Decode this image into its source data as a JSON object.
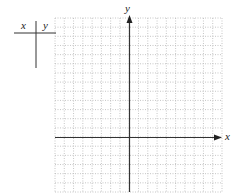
{
  "table": {
    "col1_header": "x",
    "col2_header": "y",
    "rows": []
  },
  "graph": {
    "x_axis_label": "x",
    "y_axis_label": "y",
    "grid": {
      "columns": 18,
      "rows": 19,
      "left": 55,
      "top": 18,
      "right": 222,
      "bottom": 192,
      "origin_col": 8,
      "origin_row": 13
    },
    "colors": {
      "grid_line": "#b8b8b8",
      "axis": "#333333",
      "table_line": "#333333"
    }
  }
}
